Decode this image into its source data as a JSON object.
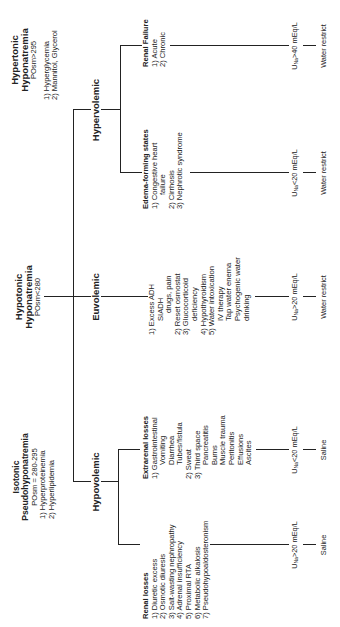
{
  "hypertonic": {
    "title1": "Hypertonic",
    "title2": "Hyponatremia",
    "posm": "POsm>295",
    "causes": [
      "1) Hyperglycemia",
      "2) Mannitol, Glycerol"
    ]
  },
  "hypotonic": {
    "title1": "Hypotonic",
    "title2": "Hyponatremia",
    "posm": "POsm<280"
  },
  "isotonic": {
    "title1": "Isotonic",
    "title2": "Pseudohyponatremia",
    "posm": "POsm = 280-295",
    "causes": [
      "1) Hyperproteinemia",
      "2) Hyperlipidemia"
    ]
  },
  "categories": {
    "hypovolemic": "Hypovolemic",
    "euvolemic": "Euvolemic",
    "hypervolemic": "Hypervolemic"
  },
  "renal_losses": {
    "title": "Renal losses",
    "items": [
      "1) Diuretic excess",
      "2) Osmotic diuresis",
      "3) Salt-wasting nephropathy",
      "4) Adrenal insufficiency",
      "5) Proximal RTA",
      "6) Metabolic alkalosis",
      "7) Pseudohypoaldosteronism"
    ],
    "una_prefix": "U",
    "una_sub": "Na",
    "una_value": ">20 mEq/L",
    "treatment": "Saline"
  },
  "extrarenal_losses": {
    "title": "Extrarenal losses",
    "items": [
      {
        "text": "1) Gastrointestinal",
        "level": 0
      },
      {
        "text": "Vomiting",
        "level": 1
      },
      {
        "text": "Diarrhea",
        "level": 1
      },
      {
        "text": "Tubes/fistula",
        "level": 1
      },
      {
        "text": "2) Sweat",
        "level": 0
      },
      {
        "text": "3) Third space",
        "level": 0
      },
      {
        "text": "Pancreatitis",
        "level": 1
      },
      {
        "text": "Burns",
        "level": 1
      },
      {
        "text": "Muscle trauma",
        "level": 1
      },
      {
        "text": "Peritonitis",
        "level": 1
      },
      {
        "text": "Effusions",
        "level": 1
      },
      {
        "text": "Ascites",
        "level": 1
      }
    ],
    "una_prefix": "U",
    "una_sub": "Na",
    "una_value": "<20 mEq/L",
    "treatment": "Saline"
  },
  "euvolemic_causes": {
    "items": [
      {
        "text": "1) Excess ADH",
        "level": 0
      },
      {
        "text": "SIADH",
        "level": 1
      },
      {
        "text": "drugs, pain",
        "level": 2
      },
      {
        "text": "2) Reset osmostat",
        "level": 0
      },
      {
        "text": "3) Glucocorticoid",
        "level": 0
      },
      {
        "text": "deficiency",
        "level": 1
      },
      {
        "text": "4) Hypothyroidism",
        "level": 0
      },
      {
        "text": "5) Water intoxication",
        "level": 0
      },
      {
        "text": "IV therapy",
        "level": 1
      },
      {
        "text": "Tap water enema",
        "level": 1
      },
      {
        "text": "Psychogenic water",
        "level": 1
      },
      {
        "text": "drinking",
        "level": 1
      }
    ],
    "una_prefix": "U",
    "una_sub": "Na",
    "una_value": ">20 mEq/L",
    "treatment": "Water restrict"
  },
  "edema_states": {
    "title": "Edema-forming states",
    "items": [
      {
        "text": "1) Congestive heart",
        "level": 0
      },
      {
        "text": "failure",
        "level": 1
      },
      {
        "text": "2) Cirrhosis",
        "level": 0
      },
      {
        "text": "3) Nephrotic syndrome",
        "level": 0
      }
    ],
    "una_prefix": "U",
    "una_sub": "Na",
    "una_value": "<20 mEq/L",
    "treatment": "Water restrict"
  },
  "renal_failure": {
    "title": "Renal Failure",
    "items": [
      "1) Acute",
      "2) Chronic"
    ],
    "una_prefix": "U",
    "una_sub": "Na",
    "una_value": ">40 mEq/L",
    "treatment": "Water restrict"
  }
}
